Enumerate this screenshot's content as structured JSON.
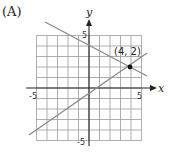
{
  "panel_label": "(A)",
  "chart_data": {
    "type": "line",
    "title": "",
    "xlabel": "x",
    "ylabel": "y",
    "xlim": [
      -5,
      5
    ],
    "ylim": [
      -5,
      5
    ],
    "grid": true,
    "x_tick_labels": [
      "-5",
      "5"
    ],
    "y_tick_labels": [
      "5",
      "-5"
    ],
    "series": [
      {
        "name": "decreasing line",
        "x": [
          -4,
          5.5
        ],
        "y": [
          5.5,
          1.3
        ],
        "color": "#888888"
      },
      {
        "name": "increasing line",
        "x": [
          -5.7,
          5.5
        ],
        "y": [
          -4.4,
          3.3
        ],
        "color": "#888888"
      }
    ],
    "annotations": [
      {
        "text": "(4, 2)",
        "x": 4,
        "y": 2,
        "marker": "point"
      }
    ]
  }
}
